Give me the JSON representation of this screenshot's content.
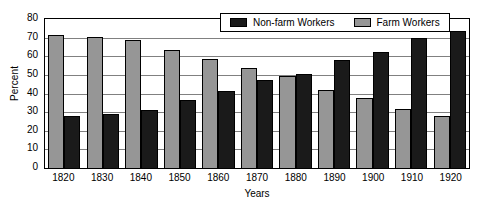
{
  "chart_data": {
    "type": "bar",
    "title": "",
    "xlabel": "Years",
    "ylabel": "Percent",
    "categories": [
      "1820",
      "1830",
      "1840",
      "1850",
      "1860",
      "1870",
      "1880",
      "1890",
      "1900",
      "1910",
      "1920"
    ],
    "series": [
      {
        "name": "Non-farm Workers",
        "color": "#1a1a1a",
        "values": [
          28,
          29,
          31,
          36.5,
          41.5,
          47,
          50.5,
          58,
          62.5,
          70,
          73.5
        ]
      },
      {
        "name": "Farm Workers",
        "color": "#969696",
        "values": [
          71.5,
          70.5,
          68.5,
          63.5,
          58.5,
          53.5,
          49.5,
          42,
          37.5,
          31.5,
          28
        ]
      }
    ],
    "ylim": [
      0,
      80
    ],
    "ytick_step": 10,
    "yticks": [
      "80",
      "70",
      "60",
      "50",
      "40",
      "30",
      "20",
      "10",
      "0"
    ],
    "grid": true,
    "grid_axis": "y",
    "legend_position": "top-right-inside",
    "bar_order_in_group": [
      "Farm Workers",
      "Non-farm Workers"
    ]
  },
  "legend": {
    "entries": [
      {
        "label": "Non-farm Workers",
        "swatch": "nonfarm"
      },
      {
        "label": "Farm Workers",
        "swatch": "farm"
      }
    ]
  }
}
